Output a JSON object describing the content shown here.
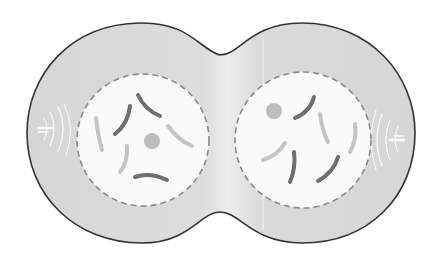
{
  "diagram": {
    "colors": {
      "background": "#ffffff",
      "cytoplasm": "#d9d9d9",
      "cytoplasm_light": "#ececec",
      "membrane": "#333333",
      "nuclear_envelope": "#8a8a8a",
      "nucleus_fill": "#fafafa",
      "chromosome_dark": "#6e6e6e",
      "chromosome_light": "#c4c4c4",
      "nucleolus": "#bdbdbd",
      "aster": "#ffffff"
    },
    "cells": [
      {
        "name": "left-daughter-cell",
        "nucleus": {
          "cx": 143,
          "cy": 140,
          "r": 66
        },
        "nucleolus": {
          "cx": 152,
          "cy": 141,
          "r": 8
        },
        "centrosome": {
          "x": 40,
          "y": 129,
          "side": "left"
        }
      },
      {
        "name": "right-daughter-cell",
        "nucleus": {
          "cx": 303,
          "cy": 140,
          "r": 68
        },
        "nucleolus": {
          "cx": 274,
          "cy": 111,
          "r": 8
        },
        "centrosome": {
          "x": 405,
          "y": 139,
          "side": "right"
        }
      }
    ]
  }
}
